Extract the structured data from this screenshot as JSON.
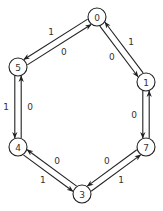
{
  "diagram": {
    "type": "state-graph",
    "nodes": [
      {
        "id": "0",
        "label": "0"
      },
      {
        "id": "1",
        "label": "1"
      },
      {
        "id": "7",
        "label": "7"
      },
      {
        "id": "3",
        "label": "3"
      },
      {
        "id": "4",
        "label": "4"
      },
      {
        "id": "5",
        "label": "5"
      }
    ],
    "edges": [
      {
        "from": "5",
        "to": "0",
        "label": "0"
      },
      {
        "from": "0",
        "to": "5",
        "label": "1"
      },
      {
        "from": "0",
        "to": "1",
        "label": "0"
      },
      {
        "from": "1",
        "to": "0",
        "label": "1"
      },
      {
        "from": "1",
        "to": "7",
        "label": "0"
      },
      {
        "from": "7",
        "to": "1",
        "label": ""
      },
      {
        "from": "7",
        "to": "3",
        "label": "0"
      },
      {
        "from": "3",
        "to": "7",
        "label": "1"
      },
      {
        "from": "3",
        "to": "4",
        "label": "0"
      },
      {
        "from": "4",
        "to": "3",
        "label": "1"
      },
      {
        "from": "4",
        "to": "5",
        "label": "0"
      },
      {
        "from": "5",
        "to": "4",
        "label": "1"
      }
    ]
  }
}
